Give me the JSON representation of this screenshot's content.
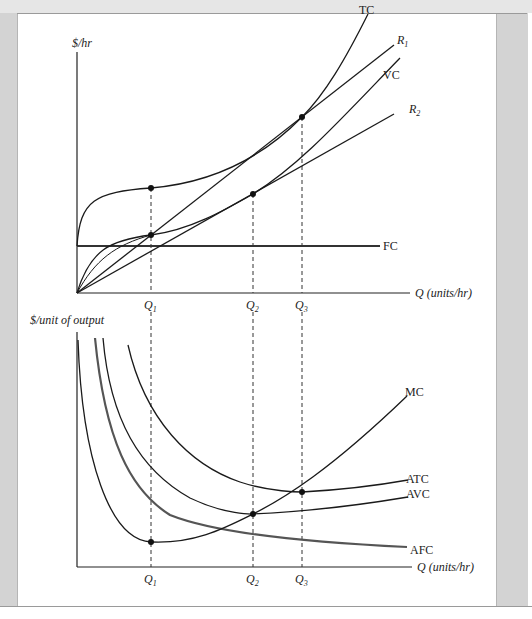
{
  "figure": {
    "top_panel": {
      "y_axis_label": "$/hr",
      "x_axis_label": "Q (units/hr)",
      "curves": [
        {
          "id": "TC",
          "label": "TC"
        },
        {
          "id": "R1",
          "label": "R",
          "subscript": "1"
        },
        {
          "id": "VC",
          "label": "VC"
        },
        {
          "id": "R2",
          "label": "R",
          "subscript": "2"
        },
        {
          "id": "FC",
          "label": "FC"
        }
      ],
      "q_markers": [
        {
          "label": "Q",
          "subscript": "1"
        },
        {
          "label": "Q",
          "subscript": "2"
        },
        {
          "label": "Q",
          "subscript": "3"
        }
      ]
    },
    "bottom_panel": {
      "y_axis_label": "$/unit of output",
      "x_axis_label": "Q (units/hr)",
      "curves": [
        {
          "id": "MC",
          "label": "MC"
        },
        {
          "id": "ATC",
          "label": "ATC"
        },
        {
          "id": "AVC",
          "label": "AVC"
        },
        {
          "id": "AFC",
          "label": "AFC"
        }
      ],
      "q_markers": [
        {
          "label": "Q",
          "subscript": "1"
        },
        {
          "label": "Q",
          "subscript": "2"
        },
        {
          "label": "Q",
          "subscript": "3"
        }
      ]
    },
    "colors": {
      "curve": "#1a1a1a",
      "afc_curve": "#555555",
      "side_band": "#d3d3d3",
      "dashed": "#333333"
    }
  }
}
